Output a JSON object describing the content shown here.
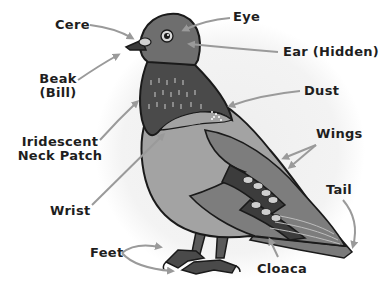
{
  "diagram": {
    "colors": {
      "background": "#ffffff",
      "halo": "#ececec",
      "head": "#6e6e6e",
      "neck": "#4a4a4a",
      "neck_spots": "#8a8a8a",
      "breast": "#a3a3a3",
      "wing": "#9a9a9a",
      "wing_bars": "#3c3c3c",
      "tail": "#707070",
      "outline": "#1a1a1a",
      "arrow": "#9a9a9a",
      "text": "#1e1e1e"
    },
    "labels": [
      {
        "id": "cere",
        "text": "Cere"
      },
      {
        "id": "beak",
        "text": "Beak",
        "text2": "(Bill)"
      },
      {
        "id": "neck",
        "text": "Iridescent",
        "text2": "Neck Patch"
      },
      {
        "id": "wrist",
        "text": "Wrist"
      },
      {
        "id": "feet",
        "text": "Feet"
      },
      {
        "id": "eye",
        "text": "Eye"
      },
      {
        "id": "ear",
        "text": "Ear (Hidden)"
      },
      {
        "id": "dust",
        "text": "Dust"
      },
      {
        "id": "wings",
        "text": "Wings"
      },
      {
        "id": "tail",
        "text": "Tail"
      },
      {
        "id": "cloaca",
        "text": "Cloaca"
      }
    ]
  }
}
